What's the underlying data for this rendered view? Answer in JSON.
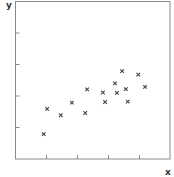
{
  "chart_data": {
    "type": "scatter",
    "title": "",
    "xlabel": "x",
    "ylabel": "y",
    "xlim": [
      0,
      5
    ],
    "ylim": [
      0,
      5
    ],
    "x_ticks": [
      1,
      2,
      3,
      4
    ],
    "y_ticks": [
      1,
      2,
      3,
      4
    ],
    "tick_labels_shown": false,
    "grid": false,
    "legend": null,
    "marker": "x",
    "series": [
      {
        "name": "data",
        "color": "#444444",
        "points": [
          {
            "x": 0.91,
            "y": 0.79
          },
          {
            "x": 1.02,
            "y": 1.59
          },
          {
            "x": 1.46,
            "y": 1.39
          },
          {
            "x": 1.82,
            "y": 1.79
          },
          {
            "x": 2.25,
            "y": 1.46
          },
          {
            "x": 2.31,
            "y": 2.21
          },
          {
            "x": 2.82,
            "y": 2.11
          },
          {
            "x": 2.89,
            "y": 1.81
          },
          {
            "x": 3.21,
            "y": 2.4
          },
          {
            "x": 3.27,
            "y": 2.1
          },
          {
            "x": 3.44,
            "y": 2.79
          },
          {
            "x": 3.56,
            "y": 2.22
          },
          {
            "x": 3.62,
            "y": 1.82
          },
          {
            "x": 3.96,
            "y": 2.68
          },
          {
            "x": 4.18,
            "y": 2.29
          }
        ]
      }
    ]
  },
  "colors": {
    "axis": "#8a8a8a",
    "marker": "#444444",
    "label": "#333333"
  }
}
